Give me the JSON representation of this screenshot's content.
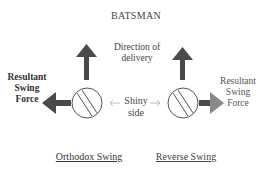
{
  "diagram": {
    "title": "BATSMAN",
    "direction_label": "Direction of delivery",
    "direction_lines": [
      "Direction of",
      "delivery"
    ],
    "shiny_lines": [
      "Shiny",
      "side"
    ],
    "resultant_left_lines": [
      "Resultant",
      "Swing",
      "Force"
    ],
    "resultant_right_lines": [
      "Resultant",
      "Swing",
      "Force"
    ],
    "panels": [
      {
        "label": "Orthodox Swing",
        "force_direction": "left",
        "shiny_side": "right"
      },
      {
        "label": "Reverse Swing",
        "force_direction": "right",
        "shiny_side": "left"
      }
    ],
    "colors": {
      "arrow": "#4a4a4a",
      "arrow_light": "#8a8a8a",
      "ball_stroke": "#555555",
      "hint_arrow": "#bbbbbb"
    }
  }
}
